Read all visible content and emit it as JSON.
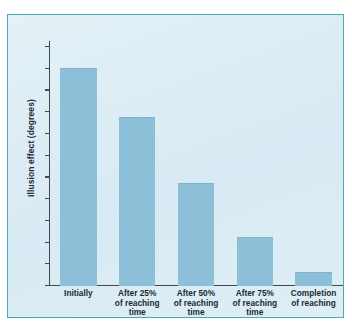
{
  "figure": {
    "panel_bg": "#dcedf4",
    "panel_border": "#4ba8bd",
    "page_bg": "#ffffff"
  },
  "chart_data": {
    "type": "bar",
    "title": "",
    "subtitle": "",
    "xlabel": "",
    "ylabel": "Illusion effect (degrees)",
    "categories": [
      "Initially",
      "After 25% of reaching time",
      "After 50% of reaching time",
      "After 75% of reaching time",
      "Completion of reaching"
    ],
    "category_lines": [
      [
        "Initially"
      ],
      [
        "After 25%",
        "of reaching",
        "time"
      ],
      [
        "After 50%",
        "of reaching",
        "time"
      ],
      [
        "After 75%",
        "of reaching",
        "time"
      ],
      [
        "Completion",
        "of reaching"
      ]
    ],
    "values": [
      10.0,
      7.75,
      4.7,
      2.2,
      0.6
    ],
    "ylim": [
      0,
      11
    ],
    "yticks": [
      0,
      1,
      2,
      3,
      4,
      5,
      6,
      7,
      8,
      9,
      10,
      11
    ],
    "ytick_labels": [
      "0",
      "1",
      "2",
      "3",
      "4",
      "5",
      "6",
      "7",
      "8",
      "9",
      "10",
      "11"
    ],
    "grid": false,
    "legend": false,
    "legend_position": "none",
    "bar_color": "#8cc0d8",
    "axis_color": "#3d4a52"
  }
}
